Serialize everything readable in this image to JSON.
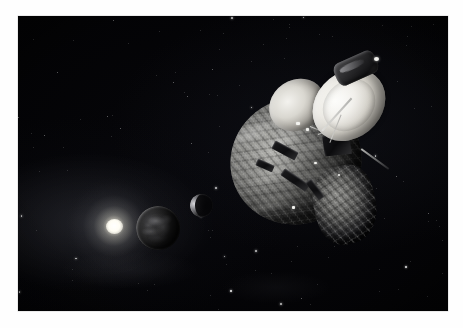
{
  "artwork": {
    "title": "New Horizons spacecraft at Pluto",
    "medium": "space art illustration",
    "frame": {
      "mat_color": "#fefefe",
      "plate_left": 18,
      "plate_top": 16,
      "plate_width": 430,
      "plate_height": 295
    },
    "background": {
      "name": "deep-space",
      "color": "#000000",
      "description": "black interplanetary sky with scattered faint stars"
    }
  },
  "celestial_bodies": [
    {
      "id": "distant-sun",
      "label": "Sun",
      "description": "distant sun rendered as a soft white radial glow",
      "color": "#fffdf4",
      "center_x": 96,
      "center_y": 210,
      "glow_diameter": 96,
      "core_diameter": 17
    },
    {
      "id": "pluto",
      "label": "Pluto",
      "description": "dim grey sphere with mottled light and dark terrain patches and a thin lit limb",
      "color": "#3a3a3c",
      "center_x": 140,
      "center_y": 212,
      "diameter": 44
    },
    {
      "id": "charon",
      "label": "Charon",
      "description": "small moon showing a bright crescent lit on its left limb",
      "color": "#e2e2e6",
      "center_x": 183,
      "center_y": 189,
      "diameter": 23
    }
  ],
  "spacecraft": {
    "id": "new-horizons",
    "label": "New Horizons",
    "description": "triangular probe wrapped in crinkled multi-layer insulation with a large white high-gain dish antenna tilted toward the upper right",
    "parts": [
      {
        "id": "spacecraft-body",
        "label": "MLI-wrapped main body",
        "color": "#8d8d8a"
      },
      {
        "id": "dish-antenna",
        "label": "High-gain dish antenna",
        "color": "#fbfbf8"
      },
      {
        "id": "secondary-dish",
        "label": "Medium-gain dish antenna",
        "color": "#f3f2ee"
      },
      {
        "id": "top-instrument",
        "label": "Top instrument module",
        "color": "#2a2a2c"
      },
      {
        "id": "electronics-box",
        "label": "Electronics box",
        "color": "#1a1a1c"
      },
      {
        "id": "lower-cluster",
        "label": "Lower instrument cluster",
        "color": "#5c5c5a"
      },
      {
        "id": "boom-arm",
        "label": "Instrument boom",
        "color": "#dcdcd8"
      }
    ]
  },
  "starfield": {
    "count": 150,
    "color": "#ffffff",
    "description": "faint scattered pinpoint stars of varying brightness"
  },
  "palette": {
    "space_black": "#000000",
    "star_white": "#ffffff",
    "sun_white": "#fffdf4",
    "foil_light": "#b8b8b4",
    "foil_dark": "#2e2e2e",
    "dish_white": "#fbfbf8",
    "pluto_grey": "#3a3a3c",
    "mat_white": "#fefefe"
  }
}
